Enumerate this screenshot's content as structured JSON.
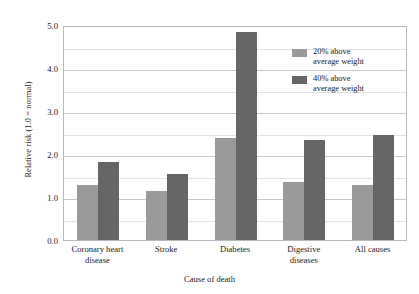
{
  "top_strip_text": "",
  "chart_data": {
    "type": "bar",
    "title": "",
    "xlabel": "Cause of death",
    "ylabel": "Relative risk (1.0 = normal)",
    "ylim": [
      0.0,
      5.0
    ],
    "ytick_labels": [
      "0.0",
      "1.0",
      "2.0",
      "3.0",
      "4.0",
      "5.0"
    ],
    "ytick_values": [
      0.0,
      1.0,
      2.0,
      3.0,
      4.0,
      5.0
    ],
    "minor_gridlines": [
      0.5,
      1.5,
      2.5,
      3.5,
      4.5
    ],
    "grid": true,
    "legend_position": "upper right inside",
    "categories": [
      "Coronary heart\ndisease",
      "Stroke",
      "Diabetes",
      "Digestive\ndiseases",
      "All causes"
    ],
    "series": [
      {
        "name": "20% above\naverage weight",
        "color": "#9a9a9a",
        "values": [
          1.27,
          1.13,
          2.37,
          1.35,
          1.29
        ]
      },
      {
        "name": "40% above\naverage weight",
        "color": "#666666",
        "values": [
          1.82,
          1.54,
          4.84,
          2.33,
          2.45
        ]
      }
    ]
  }
}
